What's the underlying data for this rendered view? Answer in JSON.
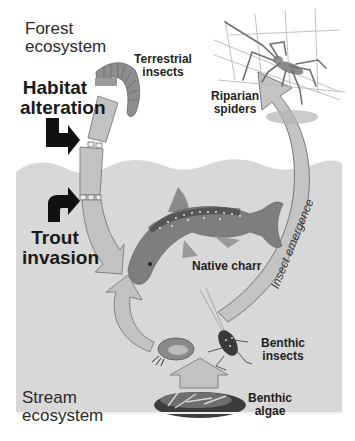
{
  "diagram": {
    "type": "food-web",
    "colors": {
      "stream_bg": "#d9d9d9",
      "arrow_fill": "#b9b9b9",
      "arrow_stroke": "#7a7a7a",
      "impact_arrow": "#111111",
      "text": "#222222"
    },
    "regions": {
      "forest": {
        "line1": "Forest",
        "line2": "ecosystem"
      },
      "stream": {
        "line1": "Stream",
        "line2": "ecosystem"
      }
    },
    "drivers": {
      "habitat": {
        "line1": "Habitat",
        "line2": "alteration"
      },
      "trout": {
        "line1": "Trout",
        "line2": "invasion"
      }
    },
    "organisms": {
      "terrestrial_insects": {
        "line1": "Terrestrial",
        "line2": "insects"
      },
      "riparian_spiders": {
        "line1": "Riparian",
        "line2": "spiders"
      },
      "native_charr": {
        "line1": "Native charr"
      },
      "benthic_insects": {
        "line1": "Benthic",
        "line2": "insects"
      },
      "benthic_algae": {
        "line1": "Benthic",
        "line2": "algae"
      }
    },
    "flows": {
      "insect_emergence": "Insect emergence"
    }
  }
}
